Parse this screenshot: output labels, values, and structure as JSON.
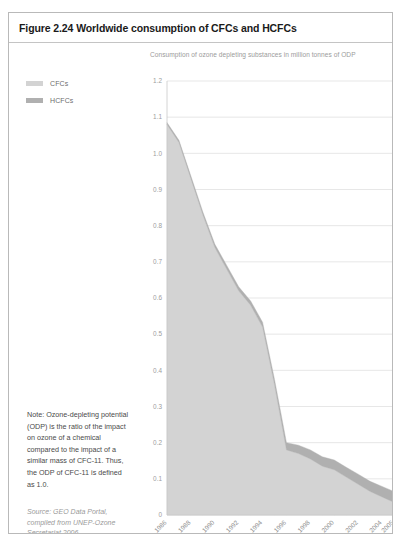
{
  "figure": {
    "title": "Figure 2.24 Worldwide consumption of CFCs and HCFCs",
    "subtitle": "Consumption of ozone depleting substances in million tonnes of ODP",
    "note": "Note: Ozone-depleting potential (ODP) is the ratio of the impact on ozone of a chemical compared to the impact of a similar mass of CFC-11. Thus, the ODP of CFC-11 is defined as 1.0.",
    "source": "Source: GEO Data Portal, compiled from UNEP-Ozone Secretariat 2006"
  },
  "legend": {
    "position": "top-left",
    "items": [
      {
        "label": "CFCs",
        "color": "#d3d3d3"
      },
      {
        "label": "HCFCs",
        "color": "#b0b0b0"
      }
    ]
  },
  "colors": {
    "cfc_fill": "#d3d3d3",
    "hcfc_fill": "#b0b0b0",
    "gridline": "#dcdcdc",
    "axis": "#c9c9c9",
    "title_text": "#1a1a1a",
    "subtitle_text": "#9b9b9b",
    "note_text": "#4a4a4a",
    "source_text": "#9a9a9a",
    "border": "#b9b9b9"
  },
  "chart_data": {
    "type": "area",
    "stacked": true,
    "title": "Worldwide consumption of CFCs and HCFCs",
    "subtitle": "Consumption of ozone depleting substances in million tonnes of ODP",
    "xlabel": "",
    "ylabel": "",
    "ylim": [
      0,
      1.2
    ],
    "grid": true,
    "ytick_labels": [
      "1.2",
      "1.1",
      "1.0",
      "0.9",
      "0.8",
      "0.7",
      "0.6",
      "0.5",
      "0.4",
      "0.3",
      "0.2",
      "0.1",
      "0"
    ],
    "ytick_values": [
      1.2,
      1.1,
      1.0,
      0.9,
      0.8,
      0.7,
      0.6,
      0.5,
      0.4,
      0.3,
      0.2,
      0.1,
      0
    ],
    "xtick_labels": [
      "1986",
      "1988",
      "1990",
      "1992",
      "1994",
      "1996",
      "1998",
      "2000",
      "2002",
      "2004",
      "2005"
    ],
    "xtick_values": [
      1986,
      1988,
      1990,
      1992,
      1994,
      1996,
      1998,
      2000,
      2002,
      2004,
      2005
    ],
    "x": [
      1986,
      1987,
      1988,
      1989,
      1990,
      1991,
      1992,
      1993,
      1994,
      1995,
      1996,
      1997,
      1998,
      1999,
      2000,
      2001,
      2002,
      2003,
      2004,
      2005
    ],
    "series": [
      {
        "name": "CFCs",
        "color": "#d3d3d3",
        "values": [
          1.08,
          1.03,
          0.93,
          0.83,
          0.74,
          0.68,
          0.62,
          0.58,
          0.52,
          0.36,
          0.18,
          0.17,
          0.155,
          0.135,
          0.125,
          0.105,
          0.085,
          0.065,
          0.05,
          0.035
        ]
      },
      {
        "name": "HCFCs",
        "color": "#b0b0b0",
        "values": [
          0.005,
          0.006,
          0.007,
          0.008,
          0.009,
          0.01,
          0.011,
          0.012,
          0.013,
          0.015,
          0.02,
          0.023,
          0.025,
          0.026,
          0.027,
          0.027,
          0.028,
          0.028,
          0.029,
          0.03
        ]
      }
    ]
  }
}
